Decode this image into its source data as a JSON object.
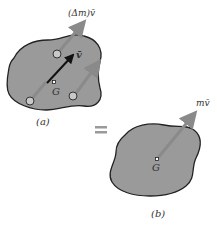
{
  "figure_a": {
    "caption": "(a)",
    "center_label": "G",
    "velocity_label": "v̄",
    "particle_momentum_label": "(Δm)v̄"
  },
  "equals_symbol": "=",
  "figure_b": {
    "caption": "(b)",
    "center_label": "G",
    "momentum_label": "mv̄"
  },
  "colors": {
    "body_fill": "#9a9a9a",
    "body_outline": "#222222",
    "particle_arrow": "#8a8a8a",
    "velocity_arrow": "#111111",
    "equals": "#9a9a9a"
  }
}
